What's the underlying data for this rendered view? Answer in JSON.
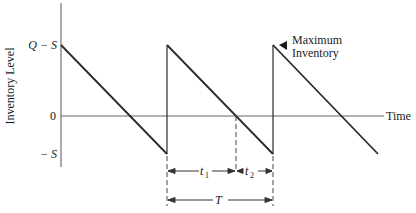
{
  "diagram": {
    "y_axis_label": "Inventory Level",
    "x_axis_label": "Time",
    "y_ticks": [
      {
        "label": "Q − S",
        "meaning": "maximum inventory level"
      },
      {
        "label": "0",
        "meaning": "zero inventory"
      },
      {
        "label": "− S",
        "meaning": "maximum shortage"
      }
    ],
    "annotation": "Maximum\nInventory",
    "annotation_lines": [
      "Maximum",
      "Inventory"
    ],
    "intervals": {
      "t1": {
        "label": "t",
        "sub": "1"
      },
      "t2": {
        "label": "t",
        "sub": "2"
      },
      "T": {
        "label": "T"
      }
    },
    "cycles": 3,
    "colors": {
      "line": "#2a2a2a",
      "axis": "#555555",
      "text": "#1a1a1a"
    }
  }
}
